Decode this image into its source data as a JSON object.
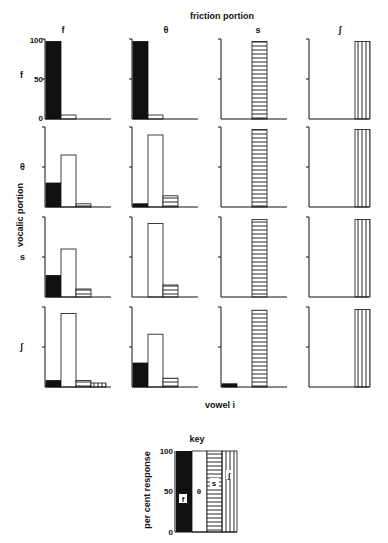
{
  "chart_data": {
    "type": "bar",
    "title": "friction portion",
    "xlabel": "vowel i",
    "ylabel": "vocalic portion",
    "column_labels": [
      "f",
      "θ",
      "s",
      "ʃ"
    ],
    "row_labels": [
      "f",
      "θ",
      "s",
      "ʃ"
    ],
    "response_categories": [
      "f",
      "θ",
      "s",
      "ʃ"
    ],
    "ylim": [
      0,
      100
    ],
    "yticks": [
      "100",
      "50",
      "0"
    ],
    "grid": false,
    "panels": [
      [
        {
          "values": [
            97,
            5,
            0,
            0
          ]
        },
        {
          "values": [
            97,
            5,
            0,
            0
          ]
        },
        {
          "values": [
            0,
            0,
            97,
            0
          ]
        },
        {
          "values": [
            0,
            0,
            0,
            97
          ]
        }
      ],
      [
        {
          "values": [
            30,
            65,
            4,
            0
          ]
        },
        {
          "values": [
            4,
            90,
            14,
            0
          ]
        },
        {
          "values": [
            0,
            0,
            97,
            0
          ]
        },
        {
          "values": [
            0,
            0,
            0,
            97
          ]
        }
      ],
      [
        {
          "values": [
            27,
            60,
            10,
            0
          ]
        },
        {
          "values": [
            0,
            92,
            15,
            0
          ]
        },
        {
          "values": [
            0,
            0,
            97,
            0
          ]
        },
        {
          "values": [
            0,
            0,
            0,
            97
          ]
        }
      ],
      [
        {
          "values": [
            8,
            92,
            8,
            5
          ]
        },
        {
          "values": [
            30,
            66,
            11,
            0
          ]
        },
        {
          "values": [
            4,
            0,
            96,
            0
          ]
        },
        {
          "values": [
            0,
            0,
            0,
            97
          ]
        }
      ]
    ],
    "key": {
      "title": "key",
      "ylabel": "per cent response",
      "yticks": [
        "100",
        "50",
        "0"
      ],
      "entries": [
        {
          "label": "f",
          "pattern": "solid-black"
        },
        {
          "label": "θ",
          "pattern": "white"
        },
        {
          "label": "s",
          "pattern": "horizontal-lines"
        },
        {
          "label": "ʃ",
          "pattern": "vertical-lines"
        }
      ]
    }
  },
  "labels": {
    "title": "friction portion",
    "ylabel": "vocalic portion",
    "xlabel": "vowel  i",
    "key_title": "key",
    "key_ylabel": "per cent response",
    "y100": "100",
    "y50": "50",
    "y0": "0",
    "cols": [
      "f",
      "θ",
      "s",
      "ʃ"
    ],
    "rows": [
      "f",
      "θ",
      "s",
      "ʃ"
    ],
    "key_entries": [
      "f",
      "θ",
      "s",
      "ʃ"
    ]
  }
}
